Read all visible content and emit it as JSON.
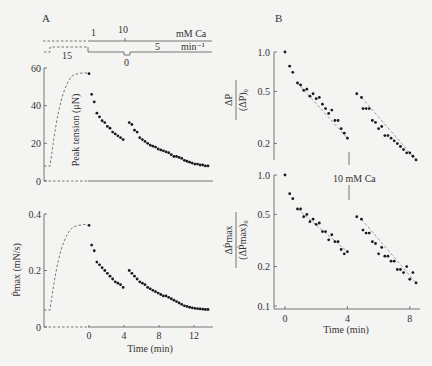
{
  "figure": {
    "panel_a_label": "A",
    "panel_b_label": "B",
    "protocol": {
      "ca_label": "mM Ca",
      "ca_values": [
        "1",
        "10"
      ],
      "rate_label": "min⁻¹",
      "rate_values": [
        "15",
        "5",
        "0"
      ]
    },
    "annotation_10mM": "10 mM Ca"
  },
  "chart_data": [
    {
      "type": "scatter",
      "panel": "A-top",
      "title": "",
      "xlabel": "Time (min)",
      "ylabel": "Peak tension (μN)",
      "xlim": [
        -3,
        14
      ],
      "ylim": [
        0,
        60
      ],
      "yticks": [
        "0",
        "20",
        "40",
        "60"
      ],
      "grid": false,
      "series": [
        {
          "name": "phase 1 (1 mM Ca)",
          "x": [
            0,
            0.3,
            0.6,
            0.9,
            1.2,
            1.5,
            1.8,
            2.1,
            2.4,
            2.7,
            3.0,
            3.3,
            3.6,
            3.9
          ],
          "y": [
            57,
            46,
            42,
            36,
            34,
            32,
            31,
            29,
            28,
            26,
            25,
            24,
            23,
            22
          ]
        },
        {
          "name": "phase 2 (10 mM Ca)",
          "x": [
            4.6,
            4.9,
            5.2,
            5.5,
            5.8,
            6.1,
            6.4,
            6.7,
            7.0,
            7.3,
            7.6,
            7.9,
            8.2,
            8.5,
            8.8,
            9.1,
            9.4,
            9.7,
            10.0,
            10.3,
            10.6,
            10.9,
            11.2,
            11.5,
            11.8,
            12.1,
            12.4,
            12.7,
            13.0,
            13.3,
            13.6
          ],
          "y": [
            31,
            30,
            27,
            26,
            23,
            22,
            21,
            20,
            19,
            18.5,
            18,
            17,
            16.5,
            16,
            15.5,
            15,
            14,
            13,
            13,
            12.5,
            12,
            11,
            10.5,
            10,
            9.5,
            9,
            9,
            8.5,
            8.5,
            8,
            8
          ]
        }
      ]
    },
    {
      "type": "scatter",
      "panel": "A-bottom",
      "xlabel": "Time (min)",
      "ylabel": "Ṗmax (mN/s)",
      "xlim": [
        -3,
        14
      ],
      "ylim": [
        0,
        0.4
      ],
      "xticks": [
        "0",
        "4",
        "8",
        "12"
      ],
      "yticks": [
        "0",
        "0.2",
        "0.4"
      ],
      "series": [
        {
          "name": "phase 1",
          "x": [
            0,
            0.3,
            0.6,
            0.9,
            1.2,
            1.5,
            1.8,
            2.1,
            2.4,
            2.7,
            3.0,
            3.3,
            3.6,
            3.9
          ],
          "y": [
            0.36,
            0.29,
            0.27,
            0.23,
            0.22,
            0.21,
            0.2,
            0.19,
            0.18,
            0.17,
            0.16,
            0.155,
            0.15,
            0.14
          ]
        },
        {
          "name": "phase 2",
          "x": [
            4.6,
            4.9,
            5.2,
            5.5,
            5.8,
            6.1,
            6.4,
            6.7,
            7.0,
            7.3,
            7.6,
            7.9,
            8.2,
            8.5,
            8.8,
            9.1,
            9.4,
            9.7,
            10.0,
            10.3,
            10.6,
            10.9,
            11.2,
            11.5,
            11.8,
            12.1,
            12.4,
            12.7,
            13.0,
            13.3,
            13.6
          ],
          "y": [
            0.2,
            0.19,
            0.18,
            0.17,
            0.16,
            0.155,
            0.15,
            0.14,
            0.135,
            0.13,
            0.125,
            0.12,
            0.115,
            0.11,
            0.11,
            0.105,
            0.1,
            0.095,
            0.09,
            0.085,
            0.08,
            0.075,
            0.073,
            0.07,
            0.068,
            0.066,
            0.065,
            0.064,
            0.063,
            0.062,
            0.062
          ]
        }
      ]
    },
    {
      "type": "scatter",
      "panel": "B-top",
      "xlabel": "",
      "ylabel": "ΔP / (ΔP)₀",
      "yscale": "log",
      "ylim": [
        0.15,
        1.0
      ],
      "yticks": [
        "0.2",
        "0.5",
        "1.0"
      ],
      "series": [
        {
          "name": "1 mM Ca",
          "x": [
            0,
            0.3,
            0.5,
            0.8,
            1.0,
            1.2,
            1.4,
            1.6,
            1.8,
            2.0,
            2.2,
            2.4,
            2.6,
            2.8,
            3.0,
            3.2,
            3.4,
            3.6,
            3.8,
            4.0
          ],
          "y": [
            1.0,
            0.78,
            0.7,
            0.58,
            0.56,
            0.51,
            0.52,
            0.46,
            0.48,
            0.44,
            0.45,
            0.4,
            0.37,
            0.34,
            0.36,
            0.3,
            0.3,
            0.26,
            0.24,
            0.22
          ]
        },
        {
          "name": "10 mM Ca",
          "x": [
            4.6,
            4.9,
            5.0,
            5.2,
            5.4,
            5.6,
            5.8,
            6.0,
            6.2,
            6.4,
            6.6,
            6.8,
            7.0,
            7.2,
            7.4,
            7.6,
            7.8,
            8.0,
            8.2,
            8.4
          ],
          "y": [
            0.48,
            0.45,
            0.37,
            0.37,
            0.37,
            0.3,
            0.29,
            0.26,
            0.27,
            0.23,
            0.23,
            0.22,
            0.21,
            0.2,
            0.19,
            0.18,
            0.17,
            0.17,
            0.16,
            0.15
          ]
        }
      ],
      "fit_lines": true
    },
    {
      "type": "scatter",
      "panel": "B-bottom",
      "xlabel": "Time (min)",
      "ylabel": "ΔṖmax / (ΔṖmax)₀",
      "yscale": "log",
      "xlim": [
        0,
        8.5
      ],
      "ylim": [
        0.1,
        1.0
      ],
      "xticks": [
        "0",
        "4",
        "8"
      ],
      "yticks": [
        "0.1",
        "0.2",
        "0.5",
        "1.0"
      ],
      "series": [
        {
          "name": "1 mM Ca",
          "x": [
            0,
            0.3,
            0.5,
            0.8,
            1.0,
            1.2,
            1.4,
            1.6,
            1.8,
            2.0,
            2.2,
            2.4,
            2.6,
            2.8,
            3.0,
            3.2,
            3.4,
            3.6,
            3.8,
            4.0
          ],
          "y": [
            1.0,
            0.72,
            0.66,
            0.55,
            0.55,
            0.48,
            0.5,
            0.44,
            0.46,
            0.42,
            0.43,
            0.37,
            0.37,
            0.32,
            0.35,
            0.31,
            0.31,
            0.27,
            0.25,
            0.26
          ]
        },
        {
          "name": "10 mM Ca",
          "x": [
            4.6,
            4.9,
            5.0,
            5.2,
            5.4,
            5.6,
            5.8,
            6.0,
            6.2,
            6.4,
            6.6,
            6.8,
            7.0,
            7.2,
            7.4,
            7.6,
            7.8,
            8.0,
            8.2,
            8.4
          ],
          "y": [
            0.48,
            0.46,
            0.38,
            0.36,
            0.36,
            0.31,
            0.3,
            0.25,
            0.28,
            0.24,
            0.24,
            0.22,
            0.22,
            0.19,
            0.19,
            0.18,
            0.2,
            0.16,
            0.18,
            0.15
          ]
        }
      ],
      "fit_lines": true
    }
  ]
}
